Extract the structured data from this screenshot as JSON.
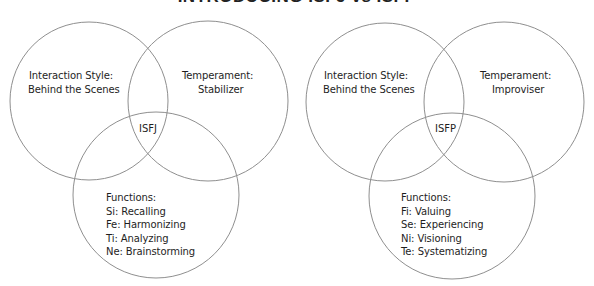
{
  "title": "INTRODUCING ISFJ vs ISFP",
  "diagrams": [
    {
      "type_code": "ISFJ",
      "interaction_style": {
        "label": "Interaction Style:",
        "value": "Behind the Scenes"
      },
      "temperament": {
        "label": "Temperament:",
        "value": "Stabilizer"
      },
      "functions": {
        "label": "Functions:",
        "items": [
          "Si: Recalling",
          "Fe: Harmonizing",
          "Ti: Analyzing",
          "Ne: Brainstorming"
        ]
      }
    },
    {
      "type_code": "ISFP",
      "interaction_style": {
        "label": "Interaction Style:",
        "value": "Behind the Scenes"
      },
      "temperament": {
        "label": "Temperament:",
        "value": "Improviser"
      },
      "functions": {
        "label": "Functions:",
        "items": [
          "Fi: Valuing",
          "Se: Experiencing",
          "Ni: Visioning",
          "Te: Systematizing"
        ]
      }
    }
  ],
  "colors": {
    "circle_stroke": "#8f8f8f",
    "text": "#1e1e1e",
    "background": "#ffffff"
  }
}
